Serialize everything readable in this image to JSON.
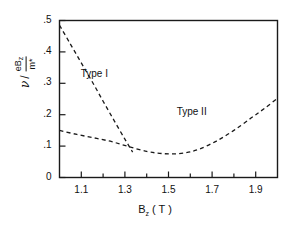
{
  "chart_data": {
    "type": "line",
    "title": "",
    "xlabel": "B_z (T)",
    "ylabel": "nu / (e B_z / m*)",
    "xlim": [
      1.0,
      2.0
    ],
    "ylim": [
      0.0,
      0.5
    ],
    "grid": false,
    "legend_position": "inline-annotations",
    "xticks": [
      "1.1",
      "1.3",
      "1.5",
      "1.7",
      "1.9"
    ],
    "xtick_values": [
      1.1,
      1.3,
      1.5,
      1.7,
      1.9
    ],
    "xminor_values": [
      1.0,
      1.2,
      1.4,
      1.6,
      1.8,
      2.0
    ],
    "yticks": [
      ".5",
      ".4",
      ".3",
      ".2",
      ".1",
      "0"
    ],
    "ytick_values": [
      0.5,
      0.4,
      0.3,
      0.2,
      0.1,
      0.0
    ],
    "linestyle": "dashed",
    "linecolor": "#1a1a1a",
    "series": [
      {
        "name": "Type I",
        "x": [
          1.0,
          1.05,
          1.1,
          1.15,
          1.2,
          1.25,
          1.3,
          1.3355
        ],
        "values": [
          0.485,
          0.425,
          0.365,
          0.305,
          0.243,
          0.182,
          0.122,
          0.081
        ]
      },
      {
        "name": "Type II",
        "x": [
          1.0,
          1.08,
          1.16,
          1.24,
          1.32,
          1.4,
          1.46,
          1.52,
          1.58,
          1.64,
          1.72,
          1.8,
          1.88,
          1.94,
          2.0
        ],
        "values": [
          0.15,
          0.137,
          0.126,
          0.114,
          0.098,
          0.083,
          0.077,
          0.075,
          0.079,
          0.09,
          0.116,
          0.15,
          0.19,
          0.22,
          0.252
        ]
      }
    ],
    "annotations": [
      {
        "text": "Type I",
        "x": 1.18,
        "y": 0.325
      },
      {
        "text": "Type II",
        "x": 1.62,
        "y": 0.205
      }
    ]
  },
  "axis_labels": {
    "x": {
      "symbol": "B",
      "subscript": "z",
      "unit": "( T )"
    },
    "y": {
      "variable": "ν",
      "slash": "/",
      "numerator_e": "e",
      "numerator_B": "B",
      "numerator_sub": "z",
      "denominator_m": "m",
      "denominator_star": "*"
    }
  }
}
